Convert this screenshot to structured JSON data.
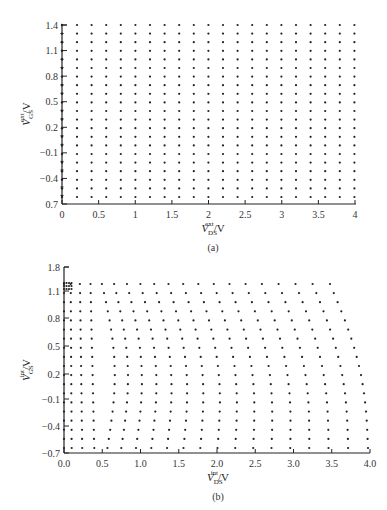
{
  "chart_data": [
    {
      "type": "scatter",
      "panel": "(a)",
      "title": "",
      "xlabel": "V_DS^ext / V",
      "ylabel": "V_GS^ext / V",
      "xlim": [
        0,
        4
      ],
      "ylim": [
        -0.7,
        1.4
      ],
      "x_ticks": [
        "0",
        "0.5",
        "1",
        "1.5",
        "2",
        "2.5",
        "3",
        "3.5",
        "4"
      ],
      "y_ticks": [
        "1.4",
        "1.1",
        "0.8",
        "0.5",
        "0.2",
        "-0.1",
        "-0.4",
        "0.7"
      ],
      "grid": false,
      "description": "Uniform rectangular grid of bias points",
      "x": [
        0.2,
        0.4,
        0.6,
        0.8,
        1.0,
        1.2,
        1.4,
        1.6,
        1.8,
        2.0,
        2.2,
        2.4,
        2.6,
        2.8,
        3.0,
        3.2,
        3.4,
        3.6,
        3.8,
        4.0
      ],
      "y": [
        1.4,
        1.3,
        1.2,
        1.1,
        1.0,
        0.9,
        0.8,
        0.7,
        0.6,
        0.5,
        0.4,
        0.3,
        0.2,
        0.1,
        0.0,
        -0.1,
        -0.2,
        -0.3,
        -0.4,
        -0.5,
        -0.6
      ]
    },
    {
      "type": "scatter",
      "panel": "(b)",
      "title": "",
      "xlabel": "V_DS^int / V",
      "ylabel": "V_GS^int / V",
      "xlim": [
        0.0,
        4.0
      ],
      "ylim": [
        -0.7,
        1.8
      ],
      "x_ticks": [
        "0.0",
        "0.5",
        "1.0",
        "1.5",
        "2.0",
        "2.5",
        "3.0",
        "3.5",
        "4.0"
      ],
      "y_ticks": [
        "1.8",
        "1.1",
        "0.8",
        "0.5",
        "0.2",
        "-0.1",
        "-0.4",
        "-0.7"
      ],
      "grid": false,
      "description": "Sheared grid of intrinsic bias points; columns slant right with decreasing V_GS, dense cluster near V_DS=0",
      "columns": 20,
      "rows": 19,
      "top_row_x_range": [
        0.0,
        3.5
      ],
      "bottom_row_x_range": [
        0.0,
        4.0
      ],
      "top_y": 1.25,
      "bottom_y": -0.6
    }
  ],
  "panels": {
    "a": {
      "caption": "(a)",
      "xlabel_main": "V",
      "xlabel_sub": "DS",
      "xlabel_sup": "ext",
      "xlabel_unit": "/V",
      "ylabel_main": "V",
      "ylabel_sub": "GS",
      "ylabel_sup": "ext",
      "ylabel_unit": "/V"
    },
    "b": {
      "caption": "(b)",
      "xlabel_main": "V",
      "xlabel_sub": "DS",
      "xlabel_sup": "int",
      "xlabel_unit": "/V",
      "ylabel_main": "V",
      "ylabel_sub": "GS",
      "ylabel_sup": "int",
      "ylabel_unit": "/V"
    }
  }
}
